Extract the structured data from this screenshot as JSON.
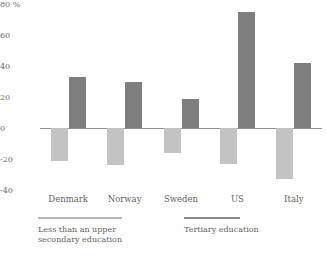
{
  "chart_data": {
    "type": "bar",
    "title": "",
    "subtitle": "",
    "xlabel": "",
    "ylabel": "",
    "unit": "%",
    "categories": [
      "Denmark",
      "Norway",
      "Sweden",
      "US",
      "Italy"
    ],
    "series": [
      {
        "name": "Less than an upper secondary education",
        "color": "#c3c3c3",
        "values": [
          -21,
          -24,
          -16,
          -23,
          -33
        ]
      },
      {
        "name": "Tertiary education",
        "color": "#7e7e7e",
        "values": [
          33,
          30,
          19,
          75,
          42
        ]
      }
    ],
    "ylim": [
      -40,
      80
    ],
    "yticks": [
      80,
      60,
      40,
      20,
      0,
      -20,
      -40
    ],
    "ytick_labels": [
      "80 %",
      "60",
      "40",
      "20",
      "0",
      "-20",
      "-40"
    ],
    "grid": false,
    "legend_position": "bottom"
  },
  "axis": {
    "y_labels": [
      {
        "text": "80 %",
        "value": 80
      },
      {
        "text": "60",
        "value": 60
      },
      {
        "text": "40",
        "value": 40
      },
      {
        "text": "20",
        "value": 20
      },
      {
        "text": "0",
        "value": 0
      },
      {
        "text": "-20",
        "value": -20
      },
      {
        "text": "-40",
        "value": -40
      }
    ]
  },
  "categories": [
    {
      "label": "Denmark"
    },
    {
      "label": "Norway"
    },
    {
      "label": "Sweden"
    },
    {
      "label": "US"
    },
    {
      "label": "Italy"
    }
  ],
  "legend": {
    "low": {
      "label": "Less than an upper secondary education",
      "color": "#c3c3c3"
    },
    "high": {
      "label": "Tertiary education",
      "color": "#7e7e7e"
    }
  }
}
